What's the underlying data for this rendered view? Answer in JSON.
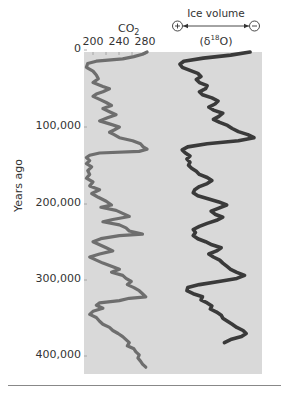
{
  "chart_data": [
    {
      "type": "line",
      "title": "CO2",
      "xlabel": "CO2",
      "ylabel": "Years ago",
      "x_ticks": [
        "200",
        "240",
        "280"
      ],
      "y_ticks": [
        "0",
        "100,000",
        "200,000",
        "300,000",
        "400,000"
      ],
      "ylim": [
        0,
        420000
      ],
      "y_inverted": true,
      "grid": false,
      "series": [
        {
          "name": "CO2 (ppm)",
          "color": "#6e6e6e",
          "points": [
            [
              0,
              282
            ],
            [
              3000,
              275
            ],
            [
              6000,
              262
            ],
            [
              9000,
              245
            ],
            [
              12000,
              205
            ],
            [
              15000,
              192
            ],
            [
              20000,
              190
            ],
            [
              25000,
              200
            ],
            [
              30000,
              205
            ],
            [
              35000,
              208
            ],
            [
              40000,
              200
            ],
            [
              45000,
              215
            ],
            [
              48000,
              225
            ],
            [
              52000,
              215
            ],
            [
              55000,
              205
            ],
            [
              58000,
              200
            ],
            [
              62000,
              210
            ],
            [
              66000,
              220
            ],
            [
              70000,
              228
            ],
            [
              74000,
              215
            ],
            [
              78000,
              225
            ],
            [
              82000,
              235
            ],
            [
              86000,
              222
            ],
            [
              90000,
              210
            ],
            [
              94000,
              225
            ],
            [
              98000,
              240
            ],
            [
              102000,
              232
            ],
            [
              105000,
              225
            ],
            [
              108000,
              232
            ],
            [
              112000,
              240
            ],
            [
              116000,
              260
            ],
            [
              120000,
              272
            ],
            [
              124000,
              276
            ],
            [
              127000,
              282
            ],
            [
              130000,
              270
            ],
            [
              132000,
              210
            ],
            [
              135000,
              195
            ],
            [
              138000,
              190
            ],
            [
              142000,
              195
            ],
            [
              146000,
              190
            ],
            [
              150000,
              198
            ],
            [
              155000,
              192
            ],
            [
              160000,
              195
            ],
            [
              165000,
              190
            ],
            [
              170000,
              200
            ],
            [
              175000,
              195
            ],
            [
              180000,
              210
            ],
            [
              185000,
              198
            ],
            [
              190000,
              208
            ],
            [
              195000,
              220
            ],
            [
              200000,
              228
            ],
            [
              203000,
              212
            ],
            [
              207000,
              235
            ],
            [
              211000,
              245
            ],
            [
              215000,
              255
            ],
            [
              219000,
              230
            ],
            [
              222000,
              215
            ],
            [
              226000,
              240
            ],
            [
              230000,
              250
            ],
            [
              234000,
              255
            ],
            [
              238000,
              275
            ],
            [
              240000,
              240
            ],
            [
              244000,
              212
            ],
            [
              248000,
              200
            ],
            [
              252000,
              210
            ],
            [
              256000,
              220
            ],
            [
              260000,
              230
            ],
            [
              264000,
              210
            ],
            [
              268000,
              195
            ],
            [
              272000,
              205
            ],
            [
              276000,
              215
            ],
            [
              280000,
              228
            ],
            [
              284000,
              240
            ],
            [
              288000,
              228
            ],
            [
              292000,
              245
            ],
            [
              296000,
              250
            ],
            [
              300000,
              258
            ],
            [
              304000,
              252
            ],
            [
              308000,
              262
            ],
            [
              312000,
              270
            ],
            [
              316000,
              275
            ],
            [
              320000,
              280
            ],
            [
              322000,
              255
            ],
            [
              325000,
              240
            ],
            [
              328000,
              210
            ],
            [
              331000,
              205
            ],
            [
              335000,
              215
            ],
            [
              339000,
              200
            ],
            [
              343000,
              195
            ],
            [
              347000,
              205
            ],
            [
              352000,
              210
            ],
            [
              356000,
              215
            ],
            [
              360000,
              225
            ],
            [
              364000,
              230
            ],
            [
              368000,
              238
            ],
            [
              372000,
              245
            ],
            [
              376000,
              250
            ],
            [
              380000,
              255
            ],
            [
              384000,
              252
            ],
            [
              388000,
              262
            ],
            [
              392000,
              265
            ],
            [
              396000,
              270
            ],
            [
              400000,
              268
            ],
            [
              404000,
              272
            ],
            [
              408000,
              275
            ],
            [
              412000,
              280
            ]
          ]
        }
      ]
    },
    {
      "type": "line",
      "title": "Ice volume (δ18O)",
      "xlabel": "Ice volume (δ18O)",
      "x_direction": "+ (more ice) left to − (less ice) right",
      "ylabel": "Years ago",
      "y_inverted": true,
      "series": [
        {
          "name": "δ18O (relative x position, 0=+ice, 1=−ice)",
          "color": "#3a3a3a",
          "points": [
            [
              0,
              0.95
            ],
            [
              4000,
              0.7
            ],
            [
              8000,
              0.35
            ],
            [
              12000,
              0.1
            ],
            [
              16000,
              0.05
            ],
            [
              20000,
              0.08
            ],
            [
              24000,
              0.18
            ],
            [
              28000,
              0.28
            ],
            [
              32000,
              0.32
            ],
            [
              36000,
              0.26
            ],
            [
              40000,
              0.3
            ],
            [
              44000,
              0.4
            ],
            [
              48000,
              0.38
            ],
            [
              52000,
              0.3
            ],
            [
              56000,
              0.34
            ],
            [
              60000,
              0.46
            ],
            [
              64000,
              0.54
            ],
            [
              68000,
              0.5
            ],
            [
              72000,
              0.42
            ],
            [
              76000,
              0.48
            ],
            [
              80000,
              0.6
            ],
            [
              84000,
              0.55
            ],
            [
              88000,
              0.48
            ],
            [
              92000,
              0.56
            ],
            [
              96000,
              0.66
            ],
            [
              100000,
              0.72
            ],
            [
              104000,
              0.8
            ],
            [
              108000,
              0.92
            ],
            [
              112000,
              1.0
            ],
            [
              116000,
              0.8
            ],
            [
              120000,
              0.4
            ],
            [
              124000,
              0.15
            ],
            [
              128000,
              0.08
            ],
            [
              132000,
              0.12
            ],
            [
              136000,
              0.18
            ],
            [
              140000,
              0.14
            ],
            [
              144000,
              0.18
            ],
            [
              148000,
              0.16
            ],
            [
              152000,
              0.2
            ],
            [
              156000,
              0.26
            ],
            [
              160000,
              0.3
            ],
            [
              164000,
              0.4
            ],
            [
              168000,
              0.46
            ],
            [
              172000,
              0.4
            ],
            [
              176000,
              0.3
            ],
            [
              180000,
              0.24
            ],
            [
              184000,
              0.22
            ],
            [
              188000,
              0.28
            ],
            [
              192000,
              0.42
            ],
            [
              196000,
              0.55
            ],
            [
              200000,
              0.65
            ],
            [
              204000,
              0.55
            ],
            [
              208000,
              0.45
            ],
            [
              212000,
              0.5
            ],
            [
              216000,
              0.6
            ],
            [
              220000,
              0.52
            ],
            [
              224000,
              0.4
            ],
            [
              228000,
              0.3
            ],
            [
              232000,
              0.22
            ],
            [
              236000,
              0.25
            ],
            [
              240000,
              0.22
            ],
            [
              244000,
              0.28
            ],
            [
              248000,
              0.38
            ],
            [
              252000,
              0.46
            ],
            [
              256000,
              0.58
            ],
            [
              260000,
              0.52
            ],
            [
              264000,
              0.42
            ],
            [
              268000,
              0.48
            ],
            [
              272000,
              0.56
            ],
            [
              276000,
              0.6
            ],
            [
              280000,
              0.65
            ],
            [
              284000,
              0.7
            ],
            [
              288000,
              0.78
            ],
            [
              292000,
              0.88
            ],
            [
              296000,
              0.78
            ],
            [
              300000,
              0.55
            ],
            [
              304000,
              0.3
            ],
            [
              308000,
              0.15
            ],
            [
              312000,
              0.14
            ],
            [
              316000,
              0.22
            ],
            [
              320000,
              0.34
            ],
            [
              324000,
              0.32
            ],
            [
              328000,
              0.4
            ],
            [
              332000,
              0.46
            ],
            [
              336000,
              0.44
            ],
            [
              340000,
              0.52
            ],
            [
              344000,
              0.58
            ],
            [
              348000,
              0.6
            ],
            [
              352000,
              0.66
            ],
            [
              356000,
              0.72
            ],
            [
              360000,
              0.78
            ],
            [
              364000,
              0.86
            ],
            [
              368000,
              0.9
            ],
            [
              372000,
              0.84
            ],
            [
              376000,
              0.7
            ],
            [
              380000,
              0.62
            ]
          ]
        }
      ]
    }
  ],
  "labels": {
    "y_axis_title": "Years ago",
    "co2_title": "CO",
    "co2_sub": "2",
    "ice_title": "Ice volume",
    "plus_symbol": "+",
    "minus_symbol": "−",
    "d18o_prefix": "(δ",
    "d18o_sup": "18",
    "d18o_suffix": "O)"
  },
  "y_ticks": [
    {
      "label": "0",
      "y": 49
    },
    {
      "label": "100,000",
      "y": 126
    },
    {
      "label": "200,000",
      "y": 203
    },
    {
      "label": "300,000",
      "y": 279
    },
    {
      "label": "400,000",
      "y": 355
    }
  ],
  "x_ticks": [
    {
      "label": "200",
      "x": 93
    },
    {
      "label": "240",
      "x": 119
    },
    {
      "label": "280",
      "x": 145
    }
  ],
  "colors": {
    "panel": "#d9d9d9",
    "co2_line": "#6e6e6e",
    "ice_line": "#3a3a3a",
    "divider": "#888888"
  }
}
